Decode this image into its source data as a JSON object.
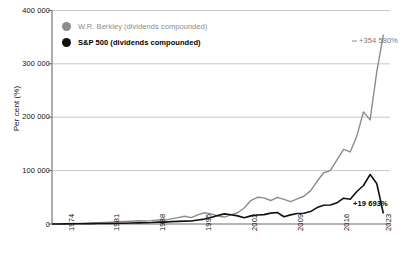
{
  "chart_data": {
    "type": "line",
    "title": "",
    "xlabel": "",
    "ylabel": "Per cent (%)",
    "ylim": [
      0,
      400000
    ],
    "xlim": [
      1973,
      2024
    ],
    "grid": true,
    "legend_position": "top-left",
    "ytick_labels": [
      "0",
      "100 000",
      "200 000",
      "300 000",
      "400 000"
    ],
    "ytick_values": [
      0,
      100000,
      200000,
      300000,
      400000
    ],
    "xtick_labels": [
      "1974",
      "1981",
      "1988",
      "1995",
      "2002",
      "2009",
      "2016",
      "2023"
    ],
    "xtick_values": [
      1974,
      1981,
      1988,
      1995,
      2002,
      2009,
      2016,
      2023
    ],
    "series": [
      {
        "name": "W.R. Berkley (dividends compounded)",
        "color": "#8c8c8c",
        "end_label": "+354 580%",
        "x": [
          1973,
          1974,
          1975,
          1976,
          1977,
          1978,
          1979,
          1980,
          1981,
          1982,
          1983,
          1984,
          1985,
          1986,
          1987,
          1988,
          1989,
          1990,
          1991,
          1992,
          1993,
          1994,
          1995,
          1996,
          1997,
          1998,
          1999,
          2000,
          2001,
          2002,
          2003,
          2004,
          2005,
          2006,
          2007,
          2008,
          2009,
          2010,
          2011,
          2012,
          2013,
          2014,
          2015,
          2016,
          2017,
          2018,
          2019,
          2020,
          2021,
          2022,
          2023
        ],
        "values": [
          0,
          300,
          500,
          800,
          1100,
          1500,
          1900,
          2300,
          2800,
          3400,
          4200,
          4600,
          5200,
          6000,
          5600,
          6400,
          7800,
          7200,
          9500,
          12000,
          14500,
          12000,
          17000,
          21000,
          19000,
          15000,
          13000,
          17000,
          21000,
          30000,
          44000,
          50000,
          49000,
          44000,
          50000,
          46000,
          42000,
          47000,
          52000,
          62000,
          80000,
          96000,
          100000,
          120000,
          140000,
          135000,
          165000,
          210000,
          195000,
          285000,
          354580
        ]
      },
      {
        "name": "S&P 500 (dividends compounded)",
        "color": "#111111",
        "end_label": "+19 693%",
        "x": [
          1973,
          1974,
          1975,
          1976,
          1977,
          1978,
          1979,
          1980,
          1981,
          1982,
          1983,
          1984,
          1985,
          1986,
          1987,
          1988,
          1989,
          1990,
          1991,
          1992,
          1993,
          1994,
          1995,
          1996,
          1997,
          1998,
          1999,
          2000,
          2001,
          2002,
          2003,
          2004,
          2005,
          2006,
          2007,
          2008,
          2009,
          2010,
          2011,
          2012,
          2013,
          2014,
          2015,
          2016,
          2017,
          2018,
          2019,
          2020,
          2021,
          2022,
          2023
        ],
        "values": [
          0,
          100,
          200,
          400,
          450,
          500,
          650,
          900,
          850,
          1050,
          1300,
          1400,
          1850,
          2200,
          2300,
          2700,
          3600,
          3500,
          4500,
          4900,
          5400,
          5500,
          7500,
          9200,
          12300,
          15800,
          19000,
          17300,
          15200,
          11800,
          15200,
          16800,
          17600,
          20400,
          21500,
          13500,
          17100,
          19700,
          20100,
          23300,
          30800,
          35000,
          35500,
          39700,
          48400,
          46300,
          60900,
          72100,
          92800,
          75900,
          19693
        ]
      }
    ],
    "annotations": [
      {
        "text": "+354 580%",
        "series": "W.R. Berkley (dividends compounded)"
      },
      {
        "text": "+19 693%",
        "series": "S&P 500 (dividends compounded)"
      }
    ]
  },
  "legend": {
    "items": [
      {
        "label": "W.R. Berkley (dividends compounded)",
        "color": "#8c8c8c"
      },
      {
        "label": "S&P 500 (dividends compounded)",
        "color": "#111111"
      }
    ]
  },
  "axis": {
    "y_title": "Per cent (%)",
    "y_ticks": [
      "400 000",
      "300 000",
      "200 000",
      "100 000",
      "0"
    ],
    "x_ticks": [
      "1974",
      "1981",
      "1988",
      "1995",
      "2002",
      "2009",
      "2016",
      "2023"
    ]
  },
  "annotations": {
    "berkley_end": "+354 580%",
    "sp500_end": "+19 693%"
  },
  "colors": {
    "berkley": "#8c8c8c",
    "sp500": "#111111",
    "grid": "#b9b9b9",
    "axis": "#6b6b6b",
    "background": "#ffffff"
  }
}
